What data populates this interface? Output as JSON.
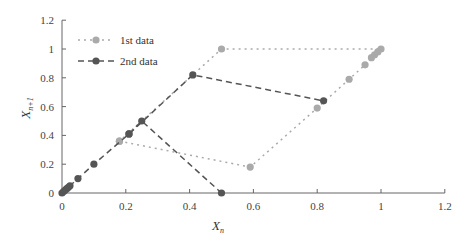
{
  "chart_data": {
    "type": "line",
    "title": "",
    "xlabel": "X_n",
    "ylabel": "X_{n+1}",
    "xlim": [
      0,
      1.2
    ],
    "ylim": [
      0,
      1.2
    ],
    "grid": false,
    "legend_position": "upper-left",
    "x_ticks": [
      "0",
      "0.2",
      "0.4",
      "0.6",
      "0.8",
      "1",
      "1.2"
    ],
    "y_ticks": [
      "0",
      "0.2",
      "0.4",
      "0.6",
      "0.8",
      "1",
      "1.2"
    ],
    "series": [
      {
        "name": "1st data",
        "style": "dotted",
        "color": "#aaaaaa",
        "points": [
          [
            0.18,
            0.36
          ],
          [
            0.59,
            0.18
          ],
          [
            0.8,
            0.59
          ],
          [
            0.9,
            0.79
          ],
          [
            0.95,
            0.89
          ],
          [
            0.97,
            0.94
          ],
          [
            0.98,
            0.96
          ],
          [
            0.99,
            0.98
          ],
          [
            1.0,
            1.0
          ],
          [
            0.5,
            1.0
          ],
          [
            0.18,
            0.36
          ]
        ]
      },
      {
        "name": "2nd data",
        "style": "dashed",
        "color": "#555555",
        "points": [
          [
            0.0,
            0.0
          ],
          [
            0.005,
            0.01
          ],
          [
            0.01,
            0.02
          ],
          [
            0.015,
            0.03
          ],
          [
            0.02,
            0.04
          ],
          [
            0.025,
            0.05
          ],
          [
            0.05,
            0.1
          ],
          [
            0.1,
            0.2
          ],
          [
            0.21,
            0.41
          ],
          [
            0.41,
            0.82
          ],
          [
            0.82,
            0.64
          ]
        ]
      },
      {
        "name": "2nd data (branch)",
        "style": "dashed",
        "color": "#555555",
        "points": [
          [
            0.21,
            0.41
          ],
          [
            0.25,
            0.5
          ],
          [
            0.5,
            0.0
          ]
        ]
      }
    ]
  },
  "legend": {
    "items": [
      {
        "label": "1st data"
      },
      {
        "label": "2nd data"
      }
    ]
  },
  "axes": {
    "xlabel_main": "X",
    "xlabel_sub": "n",
    "ylabel_main": "X",
    "ylabel_sub": "n+1"
  }
}
